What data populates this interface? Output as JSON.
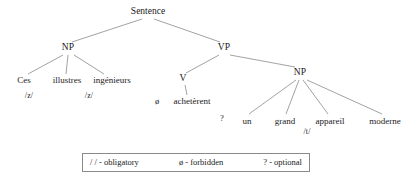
{
  "diagram": {
    "type": "syntax-tree",
    "title_node": "Sentence",
    "nodes": {
      "root": {
        "label": "Sentence",
        "x": 148,
        "y": 12
      },
      "np_subject": {
        "label": "NP",
        "x": 68,
        "y": 48
      },
      "vp": {
        "label": "VP",
        "x": 224,
        "y": 48
      },
      "v": {
        "label": "V",
        "x": 183,
        "y": 79
      },
      "np_object": {
        "label": "NP",
        "x": 300,
        "y": 73
      }
    },
    "leaves": [
      {
        "label": "Ces",
        "x": 24,
        "y": 80
      },
      {
        "label": "illustres",
        "x": 67,
        "y": 80
      },
      {
        "label": "ingénieurs",
        "x": 112,
        "y": 80
      },
      {
        "label": "achetèrent",
        "x": 192,
        "y": 101
      },
      {
        "label": "un",
        "x": 247,
        "y": 121
      },
      {
        "label": "grand",
        "x": 285,
        "y": 121
      },
      {
        "label": "appareil",
        "x": 330,
        "y": 121
      },
      {
        "label": "moderne",
        "x": 385,
        "y": 121
      }
    ],
    "liaison_marks": [
      {
        "label": "/z/",
        "x": 29,
        "y": 96
      },
      {
        "label": "/z/",
        "x": 89,
        "y": 96
      },
      {
        "label": "/t/",
        "x": 307,
        "y": 132
      }
    ],
    "forbidden_marks": [
      {
        "label": "ø",
        "x": 157,
        "y": 101
      }
    ],
    "optional_marks": [
      {
        "label": "?",
        "x": 222,
        "y": 118
      }
    ],
    "branch_color": "#8a8a8a"
  },
  "legend": {
    "entries": [
      {
        "label": "/ / - obligatory"
      },
      {
        "label": "ø - forbidden"
      },
      {
        "label": "? - optional"
      }
    ]
  }
}
